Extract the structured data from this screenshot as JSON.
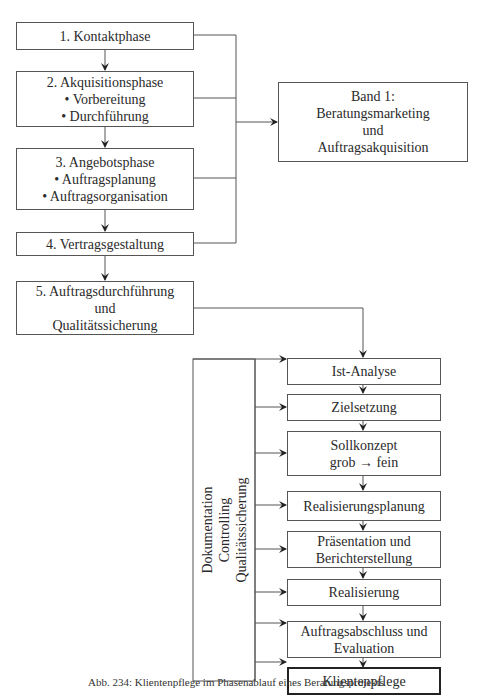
{
  "left_column": {
    "phase1": {
      "title": "1. Kontaktphase"
    },
    "phase2": {
      "title": "2. Akquisitionsphase",
      "items": [
        "• Vorbereitung",
        "• Durchführung"
      ]
    },
    "phase3": {
      "title": "3. Angebotsphase",
      "items": [
        "• Auftragsplanung",
        "• Auftragsorganisation"
      ]
    },
    "phase4": {
      "title": "4. Vertragsgestaltung"
    },
    "phase5": {
      "lines": [
        "5. Auftragsdurchführung",
        "und",
        "Qualitätssicherung"
      ]
    }
  },
  "band_box": {
    "lines": [
      "Band 1:",
      "Beratungsmarketing",
      "und",
      "Auftragsakquisition"
    ]
  },
  "side_box": {
    "lines": [
      "Dokumentation",
      "Controlling",
      "Qualitätssicherung"
    ]
  },
  "steps": [
    {
      "label": "Ist-Analyse"
    },
    {
      "label": "Zielsetzung"
    },
    {
      "line1": "Sollkonzept",
      "line2a": "grob",
      "line2b": "fein"
    },
    {
      "label": "Realisierungsplanung"
    },
    {
      "line1": "Präsentation und",
      "line2": "Berichterstellung"
    },
    {
      "label": "Realisierung"
    },
    {
      "line1": "Auftragsabschluss und",
      "line2": "Evaluation"
    },
    {
      "label": "Klientenpflege"
    }
  ],
  "caption": "Abb. 234: Klientenpflege im Phasenablauf eines Beratungsprojekts"
}
